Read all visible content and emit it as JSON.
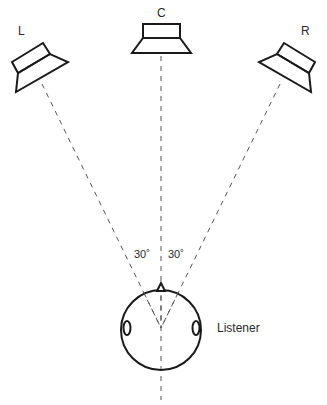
{
  "diagram": {
    "type": "stereo-speaker-layout",
    "speakers": [
      {
        "id": "left",
        "label": "L"
      },
      {
        "id": "center",
        "label": "C"
      },
      {
        "id": "right",
        "label": "R"
      }
    ],
    "angles": {
      "left_angle_label": "30˚",
      "right_angle_label": "30˚"
    },
    "listener": {
      "label": "Listener"
    },
    "colors": {
      "line": "#1a1a1a",
      "dash": "#555555",
      "text": "#2a2a2a",
      "background": "#ffffff"
    }
  }
}
